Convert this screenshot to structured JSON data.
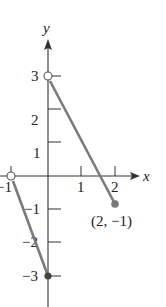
{
  "graph": {
    "type": "piecewise-linear",
    "axes": {
      "x_label": "x",
      "y_label": "y",
      "x_ticks": [
        {
          "value": -1,
          "label": "−1"
        },
        {
          "value": 1,
          "label": "1"
        },
        {
          "value": 2,
          "label": "2"
        }
      ],
      "y_ticks": [
        {
          "value": 3,
          "label": "3"
        },
        {
          "value": 2,
          "label": "2"
        },
        {
          "value": 1,
          "label": "1"
        },
        {
          "value": -1,
          "label": "−1"
        },
        {
          "value": -2,
          "label": "−2"
        },
        {
          "value": -3,
          "label": "−3"
        }
      ]
    },
    "segments": [
      {
        "from": [
          -1,
          0
        ],
        "to": [
          0,
          -3
        ],
        "from_endpoint": "open",
        "to_endpoint": "closed"
      },
      {
        "from": [
          0,
          3
        ],
        "to": [
          2,
          -1
        ],
        "from_endpoint": "open",
        "to_endpoint": "closed"
      }
    ],
    "annotations": [
      {
        "text": "(2, −1)",
        "at": [
          2,
          -1
        ]
      }
    ],
    "colors": {
      "segment": "#7a7a7a",
      "axis": "#333333"
    }
  }
}
